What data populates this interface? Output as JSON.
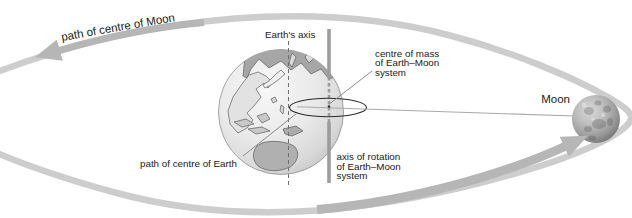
{
  "diagram": {
    "labels": {
      "moon_path": "path of centre of Moon",
      "earths_axis": "Earth's axis",
      "centre_of_mass": [
        "centre of mass",
        "of Earth–Moon",
        "system"
      ],
      "moon": "Moon",
      "earth_path": "path of centre of Earth",
      "rotation_axis": [
        "axis of rotation",
        "of Earth–Moon",
        "system"
      ]
    },
    "colors": {
      "background": "#ffffff",
      "orbit_band": "#cdcdcd",
      "direction_arrow": "#b6b6b6",
      "earth_sphere": "#e9e9e9",
      "continent_dark": "#a6a6a6",
      "continent_light": "#e2e2e2",
      "rotation_axis_line": "#9c9c9c",
      "earth_axis_line": "#6f6f6f",
      "earth_path_ellipse": "#2a2a2a",
      "moon_sphere": "#a9a9a9",
      "label_text": "#1a1a1a"
    }
  }
}
